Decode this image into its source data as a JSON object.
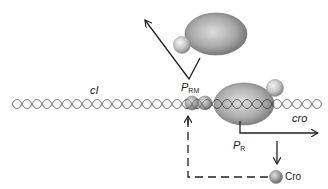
{
  "diagram": {
    "labels": {
      "gene_left": "cI",
      "gene_right": "cro",
      "promoter_left_main": "P",
      "promoter_left_sub": "RM",
      "promoter_right_main": "P",
      "promoter_right_sub": "R",
      "protein": "Cro"
    },
    "colors": {
      "dna": "#8a8a8a",
      "line": "#222222",
      "ellipse_light": "#d0d0d0",
      "ellipse_dark": "#7a7a7a",
      "ball_light": "#eeeeee",
      "ball_dark": "#9a9a9a"
    }
  }
}
